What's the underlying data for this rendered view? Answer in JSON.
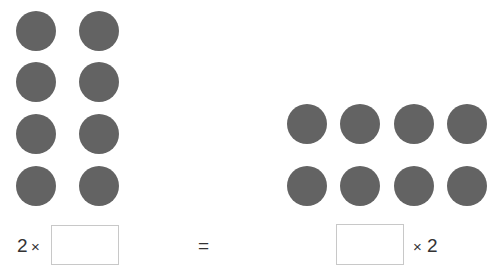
{
  "left_array": {
    "rows": 4,
    "cols": 2,
    "dot_color": "#636363"
  },
  "right_array": {
    "rows": 2,
    "cols": 4,
    "dot_color": "#636363"
  },
  "equation": {
    "left_factor": "2",
    "left_operator": "×",
    "equals": "=",
    "right_operator": "×",
    "right_factor": "2",
    "left_answer": "",
    "right_answer": ""
  }
}
